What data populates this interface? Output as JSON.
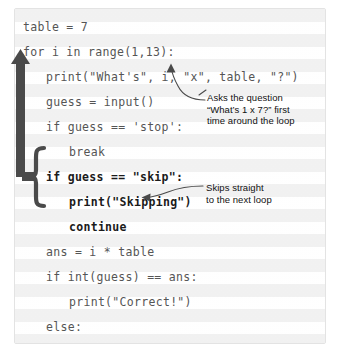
{
  "figure": {
    "kind": "annotated-python-code-listing",
    "colors": {
      "code_text": "#555555",
      "code_text_highlight": "#1b1b1b",
      "annotation_graphic": "#4a4a4a",
      "callout_text": "#111111",
      "stripe_light": "#efefef",
      "panel_background": "#fdfdfd",
      "panel_border": "#e3e3e3"
    }
  },
  "code": {
    "language": "python",
    "lines": [
      {
        "text": "table = 7",
        "indent": 0,
        "highlight": false
      },
      {
        "text": "for i in range(1,13):",
        "indent": 0,
        "highlight": false
      },
      {
        "text": "print(\"What's\", i, \"x\", table, \"?\")",
        "indent": 1,
        "highlight": false
      },
      {
        "text": "guess = input()",
        "indent": 1,
        "highlight": false
      },
      {
        "text": "if guess == 'stop':",
        "indent": 1,
        "highlight": false
      },
      {
        "text": "break",
        "indent": 2,
        "highlight": false
      },
      {
        "text": "if guess == \"skip\":",
        "indent": 1,
        "highlight": true
      },
      {
        "text": "print(\"Skipping\")",
        "indent": 2,
        "highlight": true
      },
      {
        "text": "continue",
        "indent": 2,
        "highlight": true
      },
      {
        "text": "ans = i * table",
        "indent": 1,
        "highlight": false
      },
      {
        "text": "if int(guess) == ans:",
        "indent": 1,
        "highlight": false
      },
      {
        "text": "print(\"Correct!\")",
        "indent": 2,
        "highlight": false
      },
      {
        "text": "else:",
        "indent": 1,
        "highlight": false
      },
      {
        "text": "print(\"No, it's\", ans)",
        "indent": 2,
        "highlight": false
      },
      {
        "text": "print(\"Finished\")",
        "indent": 0,
        "highlight": false
      }
    ]
  },
  "callouts": [
    {
      "id": "question-note",
      "text": "Asks the question\n“What’s 1 x 7?” first\ntime around the loop",
      "points_at": "print(\"What's\", i, \"x\", table, \"?\")"
    },
    {
      "id": "skip-note",
      "text": "Skips straight\nto the next loop",
      "points_at": "continue"
    }
  ],
  "loop_annotation": {
    "name": "continue-jumps-back-to-loop-start",
    "brace_wraps": [
      "if guess == \"skip\":",
      "print(\"Skipping\")",
      "continue"
    ],
    "arrow_points_to": "for i in range(1,13):"
  }
}
